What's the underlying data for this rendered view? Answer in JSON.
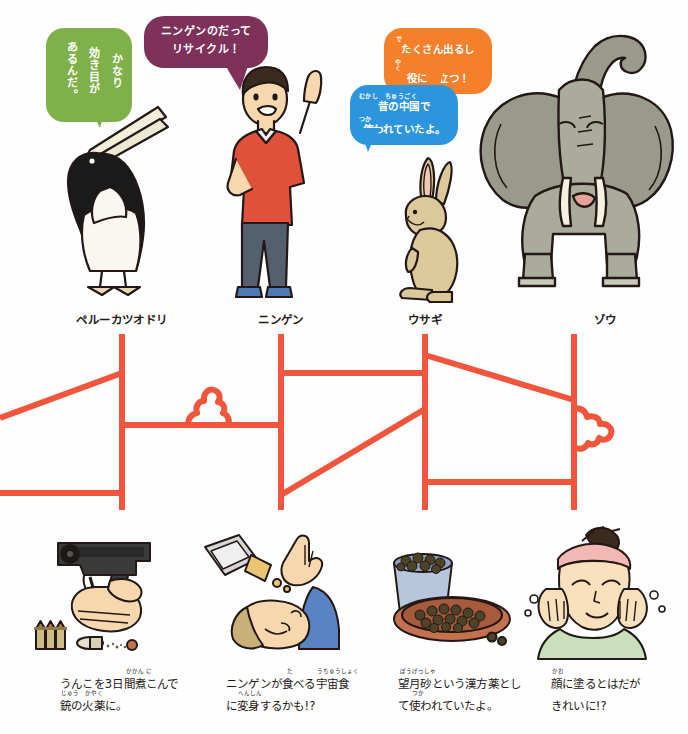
{
  "page": {
    "background": "#ffffff",
    "width": 688,
    "height": 734,
    "accent_line_color": "#F1563C"
  },
  "bubbles": [
    {
      "id": "pelican-bubble",
      "color": "#7FB04A",
      "orientation": "vertical",
      "speaker": "ペルーカツオドリ",
      "lines": [
        "かなり",
        "効き目が",
        "あるんだ。"
      ],
      "furigana": [
        {
          "base": "効",
          "reading": "き"
        }
      ],
      "text": "かなり効き目があるんだ。"
    },
    {
      "id": "human-bubble",
      "color": "#7E3159",
      "orientation": "horizontal",
      "speaker": "ニンゲン",
      "lines": [
        "ニンゲンのだって",
        "リサイクル！"
      ],
      "text": "ニンゲンのだってリサイクル！"
    },
    {
      "id": "elephant-bubble",
      "color": "#F4802C",
      "orientation": "horizontal",
      "speaker": "ゾウ",
      "lines": [
        "たくさん出るし",
        "役にも立つ！"
      ],
      "furigana": [
        {
          "base": "出",
          "reading": "で"
        },
        {
          "base": "役",
          "reading": "やく"
        },
        {
          "base": "立",
          "reading": "た"
        }
      ],
      "text": "たくさん出るし役にも立つ！"
    },
    {
      "id": "rabbit-bubble",
      "color": "#2D94DE",
      "orientation": "horizontal",
      "speaker": "ウサギ",
      "lines": [
        "昔の中国で",
        "使われていたよ。"
      ],
      "furigana": [
        {
          "base": "昔",
          "reading": "むかし"
        },
        {
          "base": "中国",
          "reading": "ちゅうごく"
        },
        {
          "base": "使",
          "reading": "つか"
        }
      ],
      "text": "昔の中国で使われていたよ。"
    }
  ],
  "animals": [
    {
      "id": "pelican",
      "label": "ペルーカツオドリ"
    },
    {
      "id": "human",
      "label": "ニンゲン"
    },
    {
      "id": "rabbit",
      "label": "ウサギ"
    },
    {
      "id": "elephant",
      "label": "ゾウ"
    }
  ],
  "uses": [
    {
      "id": "gunpowder",
      "illustration": "hand-holding-pistol-with-bullets",
      "lines": [
        "うんこを3日間煮こんで",
        "銃の火薬に。"
      ],
      "furigana": [
        {
          "base": "日間",
          "reading": "かかん"
        },
        {
          "base": "煮",
          "reading": "に"
        },
        {
          "base": "銃",
          "reading": "じゅう"
        },
        {
          "base": "火薬",
          "reading": "かやく"
        }
      ],
      "text": "うんこを3日間煮こんで銃の火薬に。"
    },
    {
      "id": "space-food",
      "illustration": "person-eating-space-food",
      "lines": [
        "ニンゲンが食べる宇宙食",
        "に変身するかも!?"
      ],
      "furigana": [
        {
          "base": "食",
          "reading": "た"
        },
        {
          "base": "宇宙食",
          "reading": "うちゅうしょく"
        },
        {
          "base": "変身",
          "reading": "へんしん"
        }
      ],
      "text": "ニンゲンが食べる宇宙食に変身するかも!?"
    },
    {
      "id": "kampo-medicine",
      "illustration": "bowls-of-herbal-pellets",
      "lines": [
        "望月砂という漢方薬とし",
        "て使われていたよ。"
      ],
      "furigana": [
        {
          "base": "望月砂",
          "reading": "ぼうげっしゃ"
        },
        {
          "base": "漢方薬",
          "reading": "かんぽうやく"
        },
        {
          "base": "使",
          "reading": "つか"
        }
      ],
      "text": "望月砂という漢方薬として使われていたよ。"
    },
    {
      "id": "skin-care",
      "illustration": "woman-applying-cream-to-face",
      "lines": [
        "顔に塗るとはだが",
        "きれいに!?"
      ],
      "furigana": [
        {
          "base": "顔",
          "reading": "かお"
        },
        {
          "base": "塗",
          "reading": "ぬ"
        }
      ],
      "text": "顔に塗るとはだがきれいに!?"
    }
  ],
  "diagram": {
    "type": "connector-routing",
    "color": "#F1563C",
    "stroke_width": 6,
    "note": "orange connector lines linking animals to uses, with two poop-shaped motifs"
  }
}
